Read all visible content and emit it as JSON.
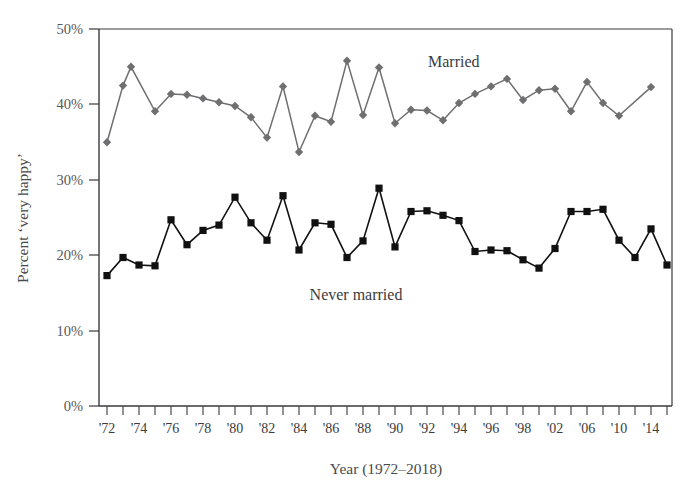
{
  "chart_data": {
    "type": "line",
    "title": "",
    "xlabel": "Year (1972–2018)",
    "ylabel": "Percent ‘very happy’",
    "ylim": [
      0,
      50
    ],
    "ytick_labels": [
      "0%",
      "10%",
      "20%",
      "30%",
      "40%",
      "50%"
    ],
    "ytick_values": [
      0,
      10,
      20,
      30,
      40,
      50
    ],
    "xtick_labels": [
      "'72",
      "'74",
      "'76",
      "'78",
      "'80",
      "'82",
      "'84",
      "'86",
      "'88",
      "'90",
      "'92",
      "'94",
      "'96",
      "'98",
      "'02",
      "'06",
      "'10",
      "'14",
      "'18"
    ],
    "grid": false,
    "legend_position": "inline-annotation",
    "x": [
      1972,
      1973,
      1974,
      1975,
      1976,
      1977,
      1978,
      1980,
      1982,
      1983,
      1984,
      1985,
      1986,
      1987,
      1988,
      1989,
      1990,
      1991,
      1993,
      1994,
      1996,
      1998,
      2000,
      2002,
      2004,
      2006,
      2008,
      2010,
      2012,
      2014,
      2016,
      2018
    ],
    "series": [
      {
        "name": "Married",
        "color": "#6f6f71",
        "marker": "diamond",
        "values": [
          34.9,
          42.5,
          45.0,
          39.1,
          41.4,
          41.4,
          40.8,
          40.3,
          39.8,
          38.3,
          35.6,
          42.4,
          33.7,
          38.5,
          37.7,
          45.8,
          38.6,
          44.9,
          37.5,
          39.3,
          39.0,
          37.9,
          40.2,
          41.4,
          42.4,
          43.4,
          40.6,
          41.9,
          42.1,
          39.1,
          43.0,
          38.5
        ],
        "last_value": 42.3
      },
      {
        "name": "Never married",
        "color": "#111111",
        "marker": "square",
        "values": [
          17.3,
          19.7,
          18.7,
          18.6,
          24.7,
          21.4,
          23.3,
          24.2,
          27.7,
          24.3,
          22.0,
          27.9,
          20.7,
          24.3,
          24.1,
          19.7,
          21.9,
          28.9,
          21.1,
          25.8,
          25.9,
          25.3,
          24.6,
          20.5,
          20.7,
          20.6,
          19.4,
          18.3,
          20.9,
          25.8,
          25.8,
          26.1
        ],
        "last_value": 18.7
      }
    ],
    "annotations": [
      {
        "name": "married-label",
        "text": "Married",
        "x_pos": 0.66,
        "y_value": 47.0
      },
      {
        "name": "never-married-label",
        "text": "Never married",
        "x_pos": 0.47,
        "y_value": 13.8
      }
    ]
  },
  "series_points": {
    "married": [
      {
        "x": 107,
        "y": 35.0
      },
      {
        "x": 123,
        "y": 42.5
      },
      {
        "x": 131,
        "y": 45.0
      },
      {
        "x": 155,
        "y": 39.1
      },
      {
        "x": 171,
        "y": 41.4
      },
      {
        "x": 187,
        "y": 41.3
      },
      {
        "x": 203,
        "y": 40.8
      },
      {
        "x": 219,
        "y": 40.3
      },
      {
        "x": 235,
        "y": 39.8
      },
      {
        "x": 251,
        "y": 38.3
      },
      {
        "x": 267,
        "y": 35.6
      },
      {
        "x": 283,
        "y": 42.4
      },
      {
        "x": 299,
        "y": 33.7
      },
      {
        "x": 315,
        "y": 38.5
      },
      {
        "x": 331,
        "y": 37.7
      },
      {
        "x": 347,
        "y": 45.8
      },
      {
        "x": 363,
        "y": 38.6
      },
      {
        "x": 379,
        "y": 44.9
      },
      {
        "x": 395,
        "y": 37.5
      },
      {
        "x": 411,
        "y": 39.3
      },
      {
        "x": 427,
        "y": 39.2
      },
      {
        "x": 443,
        "y": 37.9
      },
      {
        "x": 459,
        "y": 40.2
      },
      {
        "x": 475,
        "y": 41.4
      },
      {
        "x": 491,
        "y": 42.4
      },
      {
        "x": 507,
        "y": 43.4
      },
      {
        "x": 523,
        "y": 40.6
      },
      {
        "x": 539,
        "y": 41.9
      },
      {
        "x": 555,
        "y": 42.1
      },
      {
        "x": 571,
        "y": 39.1
      },
      {
        "x": 587,
        "y": 43.0
      },
      {
        "x": 603,
        "y": 40.2
      },
      {
        "x": 619,
        "y": 38.5
      },
      {
        "x": 651,
        "y": 42.3
      }
    ],
    "never_married": [
      {
        "x": 107,
        "y": 17.3
      },
      {
        "x": 123,
        "y": 19.7
      },
      {
        "x": 139,
        "y": 18.7
      },
      {
        "x": 155,
        "y": 18.6
      },
      {
        "x": 171,
        "y": 24.7
      },
      {
        "x": 187,
        "y": 21.4
      },
      {
        "x": 203,
        "y": 23.3
      },
      {
        "x": 219,
        "y": 24.0
      },
      {
        "x": 235,
        "y": 27.7
      },
      {
        "x": 251,
        "y": 24.3
      },
      {
        "x": 267,
        "y": 22.0
      },
      {
        "x": 283,
        "y": 27.9
      },
      {
        "x": 299,
        "y": 20.7
      },
      {
        "x": 315,
        "y": 24.3
      },
      {
        "x": 331,
        "y": 24.1
      },
      {
        "x": 347,
        "y": 19.7
      },
      {
        "x": 363,
        "y": 21.9
      },
      {
        "x": 379,
        "y": 28.9
      },
      {
        "x": 395,
        "y": 21.1
      },
      {
        "x": 411,
        "y": 25.8
      },
      {
        "x": 427,
        "y": 25.9
      },
      {
        "x": 443,
        "y": 25.3
      },
      {
        "x": 459,
        "y": 24.6
      },
      {
        "x": 475,
        "y": 20.5
      },
      {
        "x": 491,
        "y": 20.7
      },
      {
        "x": 507,
        "y": 20.6
      },
      {
        "x": 523,
        "y": 19.4
      },
      {
        "x": 539,
        "y": 18.3
      },
      {
        "x": 555,
        "y": 20.9
      },
      {
        "x": 571,
        "y": 25.8
      },
      {
        "x": 587,
        "y": 25.8
      },
      {
        "x": 603,
        "y": 26.1
      },
      {
        "x": 619,
        "y": 22.0
      },
      {
        "x": 635,
        "y": 19.7
      },
      {
        "x": 651,
        "y": 23.5
      },
      {
        "x": 667,
        "y": 18.7
      }
    ]
  },
  "axes": {
    "y_title": "Percent ‘very happy’",
    "x_title": "Year (1972–2018)",
    "y_ticks": [
      "50%",
      "40%",
      "30%",
      "20%",
      "10%",
      "0%"
    ],
    "x_ticks": [
      "'72",
      "'74",
      "'76",
      "'78",
      "'80",
      "'82",
      "'84",
      "'86",
      "'88",
      "'90",
      "'92",
      "'94",
      "'96",
      "'98",
      "'02",
      "'06",
      "'10",
      "'14",
      "'18"
    ]
  },
  "labels": {
    "married": "Married",
    "never_married": "Never married"
  },
  "colors": {
    "married_line": "#6f6f71",
    "never_married_line": "#111111",
    "axis": "#3a3a3c",
    "tick_text": "#58585a",
    "background": "#ffffff"
  }
}
